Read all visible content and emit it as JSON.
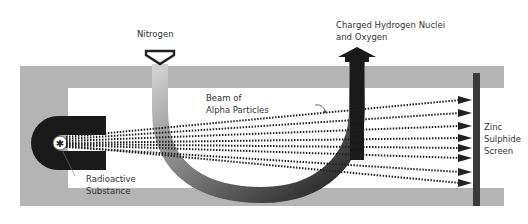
{
  "diagram": {
    "labels": {
      "nitrogen": "Nitrogen",
      "products_line1": "Charged Hydrogen Nuclei",
      "products_line2": "and Oxygen",
      "beam_line1": "Beam of",
      "beam_line2": "Alpha Particles",
      "source_line1": "Radioactive",
      "source_line2": "Substance",
      "screen_line1": "Zinc",
      "screen_line2": "Sulphide",
      "screen_line3": "Screen"
    },
    "colors": {
      "frame": "#b4b4b4",
      "dark": "#1e1e1e",
      "background": "#ffffff"
    }
  }
}
